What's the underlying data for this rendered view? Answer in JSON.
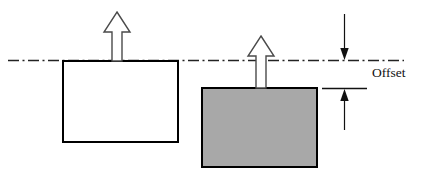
{
  "figure": {
    "kind": "engineering-offset-diagram",
    "background_color": "#ffffff",
    "width": 424,
    "height": 180
  },
  "annotations": {
    "offset_label": "Offset"
  },
  "colors": {
    "stroke": "#111111",
    "shape_outline": "#000000",
    "white_fill": "#ffffff",
    "gray_fill": "#a8a8a8",
    "centerline": "#222222",
    "arrow_outline": "#444444",
    "arrow_fill": "#ffffff"
  },
  "centerline": {
    "name": "reference-centerline",
    "y": 60,
    "x_start": 8,
    "x_end": 404,
    "style": "dash-dot"
  },
  "shapes": [
    {
      "id": "left-block",
      "label": "white-block",
      "fill": "#ffffff",
      "stroke": "#000000",
      "stroke_width": 2,
      "x": 63,
      "y": 61,
      "width": 115,
      "height": 81
    },
    {
      "id": "right-block",
      "label": "gray-block",
      "fill": "#a8a8a8",
      "stroke": "#000000",
      "stroke_width": 2,
      "x": 202,
      "y": 88,
      "width": 115,
      "height": 79
    }
  ],
  "arrows": [
    {
      "id": "left-force-arrow",
      "direction": "up",
      "center_x": 117,
      "tip_y": 12,
      "base_y": 61,
      "shaft_half_width": 5,
      "head_half_width": 13,
      "head_height": 20
    },
    {
      "id": "right-force-arrow",
      "direction": "up",
      "center_x": 261,
      "tip_y": 36,
      "base_y": 88,
      "shaft_half_width": 5,
      "head_half_width": 13,
      "head_height": 20
    }
  ],
  "dimension": {
    "id": "offset-dimension",
    "x": 344,
    "top_y": 60,
    "bottom_y": 88,
    "upper_leader_start_y": 14,
    "lower_leader_end_y": 130,
    "extension_line": {
      "x_start": 322,
      "x_end": 367,
      "y": 88
    },
    "label_x": 372,
    "label_y": 72
  }
}
